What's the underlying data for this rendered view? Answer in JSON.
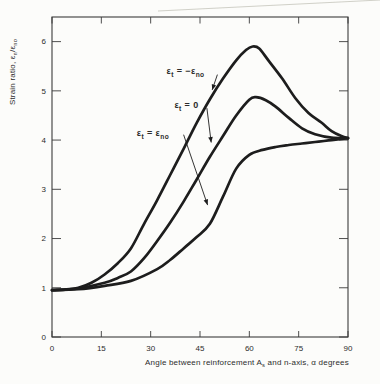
{
  "figure": {
    "background": "#fcfcfa",
    "ink": "#1d1d1d",
    "frame": "#3b3b3b",
    "text": "#2c2c2c",
    "artifact": "#cbcbc2"
  },
  "chart_data": {
    "type": "line",
    "title": "",
    "xlabel": "Angle between reinforcement As and n-axis, α degrees",
    "ylabel": "Strain ratio, εn/εno",
    "xlabel_segments": [
      [
        "Angle between reinforcement A",
        0
      ],
      [
        "s",
        1
      ],
      [
        " and n-axis, ",
        0
      ],
      [
        "α degrees",
        0
      ]
    ],
    "ylabel_segments": [
      [
        "Strain ratio, ",
        0
      ],
      [
        "ε",
        0
      ],
      [
        "n",
        1
      ],
      [
        "/",
        0
      ],
      [
        "ε",
        0
      ],
      [
        "no",
        1
      ]
    ],
    "xlim": [
      0,
      90
    ],
    "ylim": [
      0,
      6.5
    ],
    "x_ticks": [
      0,
      15,
      30,
      45,
      60,
      75,
      90
    ],
    "y_ticks": [
      0,
      1,
      2,
      3,
      4,
      5,
      6
    ],
    "grid": false,
    "legend_position": "inline-annotations",
    "series": [
      {
        "id": "et-neg-eno",
        "label": "εt = −εno",
        "label_segments": [
          [
            "ε",
            0
          ],
          [
            "t",
            1
          ],
          [
            " = −",
            0
          ],
          [
            "ε",
            0
          ],
          [
            "no",
            1
          ]
        ],
        "label_x": 40.6,
        "label_y": 5.4,
        "leader": [
          50.3,
          5.33,
          48.7,
          5.02
        ],
        "points": [
          [
            0,
            0.95
          ],
          [
            4,
            0.96
          ],
          [
            8,
            1.0
          ],
          [
            12,
            1.1
          ],
          [
            16,
            1.27
          ],
          [
            20,
            1.5
          ],
          [
            24,
            1.8
          ],
          [
            28,
            2.3
          ],
          [
            32,
            2.78
          ],
          [
            36,
            3.3
          ],
          [
            40,
            3.82
          ],
          [
            44,
            4.35
          ],
          [
            48,
            4.83
          ],
          [
            52,
            5.25
          ],
          [
            56,
            5.62
          ],
          [
            59,
            5.83
          ],
          [
            61,
            5.9
          ],
          [
            63,
            5.86
          ],
          [
            66,
            5.6
          ],
          [
            70,
            5.25
          ],
          [
            74,
            4.85
          ],
          [
            78,
            4.55
          ],
          [
            82,
            4.35
          ],
          [
            85,
            4.18
          ],
          [
            88,
            4.08
          ],
          [
            90,
            4.04
          ]
        ]
      },
      {
        "id": "et-zero",
        "label": "εt = 0",
        "label_segments": [
          [
            "ε",
            0
          ],
          [
            "t",
            1
          ],
          [
            " = 0",
            0
          ]
        ],
        "label_x": 40.9,
        "label_y": 4.71,
        "leader": [
          47.1,
          4.65,
          48.4,
          3.95
        ],
        "points": [
          [
            0,
            0.95
          ],
          [
            8,
            0.99
          ],
          [
            16,
            1.1
          ],
          [
            20,
            1.2
          ],
          [
            24,
            1.33
          ],
          [
            28,
            1.6
          ],
          [
            32,
            1.95
          ],
          [
            36,
            2.33
          ],
          [
            40,
            2.75
          ],
          [
            44,
            3.2
          ],
          [
            48,
            3.66
          ],
          [
            52,
            4.08
          ],
          [
            56,
            4.5
          ],
          [
            60,
            4.82
          ],
          [
            62,
            4.87
          ],
          [
            65,
            4.81
          ],
          [
            68,
            4.68
          ],
          [
            72,
            4.45
          ],
          [
            76,
            4.24
          ],
          [
            80,
            4.12
          ],
          [
            85,
            4.05
          ],
          [
            90,
            4.04
          ]
        ]
      },
      {
        "id": "et-eno",
        "label": "εt = εno",
        "label_segments": [
          [
            "ε",
            0
          ],
          [
            "t",
            1
          ],
          [
            " = ",
            0
          ],
          [
            "ε",
            0
          ],
          [
            "no",
            1
          ]
        ],
        "label_x": 30.7,
        "label_y": 4.14,
        "leader": [
          40.0,
          4.11,
          47.3,
          2.68
        ],
        "points": [
          [
            0,
            0.95
          ],
          [
            8,
            0.97
          ],
          [
            16,
            1.04
          ],
          [
            24,
            1.14
          ],
          [
            32,
            1.38
          ],
          [
            36,
            1.57
          ],
          [
            40,
            1.8
          ],
          [
            44,
            2.03
          ],
          [
            48,
            2.3
          ],
          [
            52,
            2.85
          ],
          [
            56,
            3.42
          ],
          [
            60,
            3.7
          ],
          [
            64,
            3.8
          ],
          [
            68,
            3.86
          ],
          [
            72,
            3.9
          ],
          [
            76,
            3.93
          ],
          [
            80,
            3.96
          ],
          [
            85,
            4.0
          ],
          [
            90,
            4.04
          ]
        ]
      }
    ]
  }
}
